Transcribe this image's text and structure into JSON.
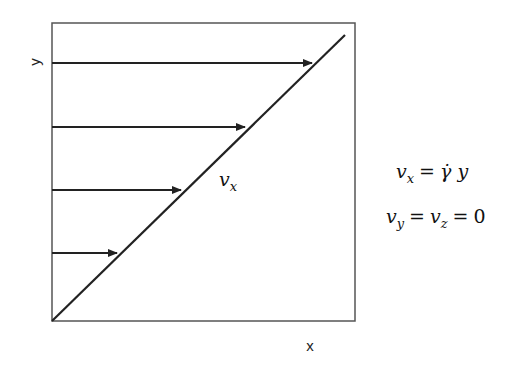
{
  "diagram": {
    "axes": {
      "x_label": "x",
      "y_label": "y"
    },
    "profile_label": {
      "symbol": "v",
      "subscript": "x"
    },
    "arrows": [
      {
        "y": 63,
        "x_end": 312
      },
      {
        "y": 127,
        "x_end": 245
      },
      {
        "y": 190,
        "x_end": 181
      },
      {
        "y": 253,
        "x_end": 117
      }
    ],
    "equations": [
      {
        "lhs_symbol": "v",
        "lhs_sub": "x",
        "op": "=",
        "rhs": "γ̇ y"
      },
      {
        "a_symbol": "v",
        "a_sub": "y",
        "op1": "=",
        "b_symbol": "v",
        "b_sub": "z",
        "op2": "=",
        "value": "0"
      }
    ],
    "colors": {
      "line": "#222222",
      "box": "#555555"
    }
  }
}
